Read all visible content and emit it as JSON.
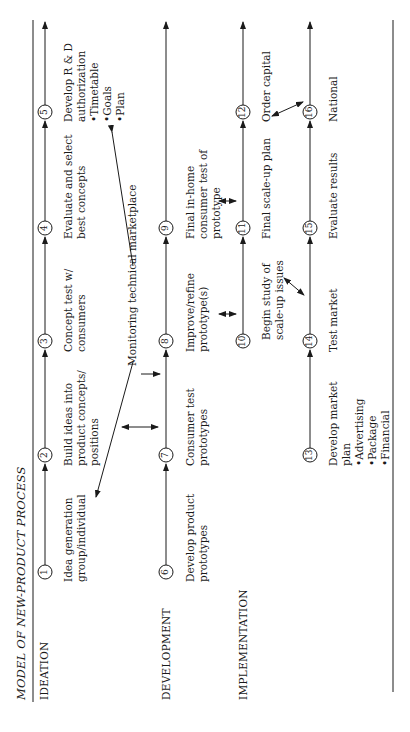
{
  "title": "MODEL OF NEW-PRODUCT PROCESS",
  "phases": [
    {
      "label": "IDEATION"
    },
    {
      "label": "DEVELOPMENT"
    },
    {
      "label": "IMPLEMENTATION"
    }
  ],
  "steps": [
    {
      "n": "1",
      "label": "Idea generation\ngroup/individual"
    },
    {
      "n": "2",
      "label": "Build ideas into\nproduct concepts/\npositions"
    },
    {
      "n": "3",
      "label": "Concept test w/\nconsumers"
    },
    {
      "n": "4",
      "label": "Evaluate and select\nbest concepts"
    },
    {
      "n": "5",
      "label": "Develop R & D\nauthorization",
      "bullets": [
        "Timetable",
        "Goals",
        "Plan"
      ]
    },
    {
      "n": "6",
      "label": "Develop product\nprototypes"
    },
    {
      "n": "7",
      "label": "Consumer test\nprototypes"
    },
    {
      "n": "8",
      "label": "Improve/refine\nprototype(s)"
    },
    {
      "n": "9",
      "label": "Final in-home\nconsumer test of\nprototype"
    },
    {
      "n": "10",
      "label": "Begin study of\nscale-up issues"
    },
    {
      "n": "11",
      "label": "Final scale-up plan"
    },
    {
      "n": "12",
      "label": "Order capital"
    },
    {
      "n": "13",
      "label": "Develop market\nplan",
      "bullets": [
        "Advertising",
        "Package",
        "Financial"
      ]
    },
    {
      "n": "14",
      "label": "Test market"
    },
    {
      "n": "15",
      "label": "Evaluate results"
    },
    {
      "n": "16",
      "label": "National"
    }
  ],
  "annotations": {
    "monitoring": "Monitoring technical marketplace"
  }
}
